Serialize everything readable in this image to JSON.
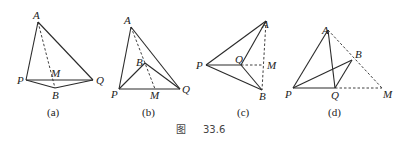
{
  "figure": {
    "caption_prefix": "图",
    "caption_number": "33.6"
  },
  "panels": [
    {
      "id": "a",
      "caption": "(a)",
      "points": {
        "A": {
          "label": "A",
          "x": 38,
          "y": 22
        },
        "P": {
          "label": "P",
          "x": 26,
          "y": 80
        },
        "Q": {
          "label": "Q",
          "x": 93,
          "y": 80
        },
        "B": {
          "label": "B",
          "x": 55,
          "y": 88
        },
        "M": {
          "label": "M",
          "x": 50,
          "y": 80
        }
      },
      "solid_segments": [
        [
          "A",
          "P"
        ],
        [
          "A",
          "Q"
        ],
        [
          "P",
          "Q"
        ],
        [
          "P",
          "B"
        ],
        [
          "B",
          "Q"
        ]
      ],
      "dashed_segments": [
        [
          "A",
          "B"
        ]
      ]
    },
    {
      "id": "b",
      "caption": "(b)",
      "points": {
        "A": {
          "label": "A",
          "x": 131,
          "y": 27
        },
        "P": {
          "label": "P",
          "x": 119,
          "y": 89
        },
        "Q": {
          "label": "Q",
          "x": 180,
          "y": 89
        },
        "B": {
          "label": "B",
          "x": 145,
          "y": 63
        },
        "M": {
          "label": "M",
          "x": 155,
          "y": 89
        }
      },
      "solid_segments": [
        [
          "A",
          "P"
        ],
        [
          "A",
          "Q"
        ],
        [
          "P",
          "Q"
        ],
        [
          "P",
          "B"
        ],
        [
          "B",
          "Q"
        ]
      ],
      "dashed_segments": [
        [
          "A",
          "M"
        ]
      ]
    },
    {
      "id": "c",
      "caption": "(c)",
      "points": {
        "A": {
          "label": "A",
          "x": 266,
          "y": 21
        },
        "P": {
          "label": "P",
          "x": 206,
          "y": 65
        },
        "Q": {
          "label": "Q",
          "x": 241,
          "y": 65
        },
        "M": {
          "label": "M",
          "x": 263,
          "y": 65
        },
        "B": {
          "label": "B",
          "x": 262,
          "y": 90
        }
      },
      "solid_segments": [
        [
          "P",
          "A"
        ],
        [
          "P",
          "Q"
        ],
        [
          "P",
          "B"
        ],
        [
          "Q",
          "A"
        ],
        [
          "Q",
          "B"
        ]
      ],
      "dashed_segments": [
        [
          "A",
          "B"
        ],
        [
          "Q",
          "M"
        ]
      ]
    },
    {
      "id": "d",
      "caption": "(d)",
      "points": {
        "A": {
          "label": "A",
          "x": 328,
          "y": 30
        },
        "B": {
          "label": "B",
          "x": 352,
          "y": 60
        },
        "P": {
          "label": "P",
          "x": 293,
          "y": 88
        },
        "Q": {
          "label": "Q",
          "x": 335,
          "y": 88
        },
        "M": {
          "label": "M",
          "x": 382,
          "y": 88
        }
      },
      "solid_segments": [
        [
          "P",
          "A"
        ],
        [
          "A",
          "Q"
        ],
        [
          "P",
          "Q"
        ],
        [
          "P",
          "B"
        ],
        [
          "B",
          "Q"
        ]
      ],
      "dashed_segments": [
        [
          "A",
          "M"
        ],
        [
          "Q",
          "M"
        ]
      ]
    }
  ]
}
